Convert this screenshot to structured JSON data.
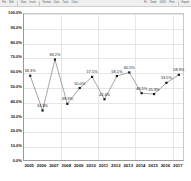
{
  "toolbar": {
    "items": [
      "File",
      "Edit",
      "View",
      "Insert",
      "Format",
      "Data",
      "Tools",
      "Chart",
      "Help"
    ],
    "right_items": [
      "Fit",
      "Zoom",
      "100%",
      "Print",
      "Export"
    ]
  },
  "chart_data": {
    "type": "line",
    "title": "",
    "subtitle": "",
    "xlabel": "",
    "ylabel": "",
    "categories": [
      "2005",
      "2006",
      "2007",
      "2008",
      "2009",
      "2010",
      "2011",
      "2012",
      "2013",
      "2014",
      "2015",
      "2016",
      "2017"
    ],
    "values": [
      58.3,
      34.8,
      69.2,
      39.3,
      50.0,
      57.5,
      42.4,
      58.1,
      60.5,
      46.5,
      45.9,
      53.5,
      58.9
    ],
    "point_labels": [
      "58.3%",
      "34.8%",
      "69.2%",
      "39.3%",
      "50.0%",
      "57.5%",
      "42.4%",
      "58.1%",
      "60.5%",
      "46.5%",
      "45.9%",
      "53.5%",
      "58.9%"
    ],
    "ylim": [
      0,
      100
    ],
    "ytick_values": [
      0,
      10,
      20,
      30,
      40,
      50,
      60,
      70,
      80,
      90,
      100
    ],
    "ytick_labels": [
      "0.0%",
      "10.0%",
      "20.0%",
      "30.0%",
      "40.0%",
      "50.0%",
      "60.0%",
      "70.0%",
      "80.0%",
      "90.0%",
      "100.0%"
    ],
    "grid": true,
    "legend": "none",
    "series_color": "#808080",
    "marker_color": "#1a1a1a",
    "marker": "square",
    "gridline_color": "#e6e6e6",
    "axis_color": "#9a9a9a"
  }
}
